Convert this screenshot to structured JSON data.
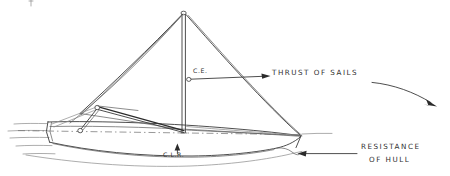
{
  "figure": {
    "medium": "hand-drawn pencil sketch",
    "background_color": "#ffffff",
    "ink_color": "#3a3a3a"
  },
  "labels": {
    "thrust_of_sails": "THRUST OF SAILS",
    "resistance_line1": "RESISTANCE",
    "resistance_line2": "OF HULL",
    "center_of_effort": "C.E.",
    "center_of_lateral_resistance": "C.L.R."
  },
  "annotations": {
    "thrust_arrow_direction": "right",
    "resistance_arrow_direction": "left",
    "clr_arrow_direction": "up",
    "sweep_arrow_direction": "down-right"
  },
  "geometry": {
    "masthead": {
      "x": 183,
      "y": 13
    },
    "mast_base": {
      "x": 183,
      "y": 133
    },
    "bow": {
      "x": 48,
      "y": 127
    },
    "stern": {
      "x": 301,
      "y": 136
    },
    "ce_point": {
      "x": 189,
      "y": 79
    },
    "clr_point": {
      "x": 177,
      "y": 148
    },
    "waterline_y": 130
  }
}
